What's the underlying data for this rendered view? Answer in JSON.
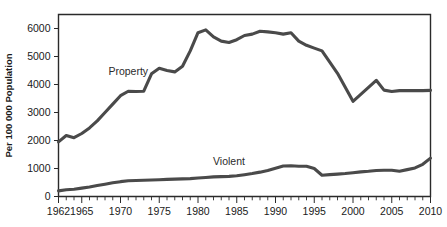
{
  "chart_data": {
    "type": "line",
    "title": "",
    "xlabel": "",
    "ylabel": "Per 100 000 Population",
    "xlim": [
      1962,
      2010
    ],
    "ylim": [
      0,
      6500
    ],
    "grid": false,
    "legend_position": "inline-labels",
    "y_ticks": [
      0,
      1000,
      2000,
      3000,
      4000,
      5000,
      6000
    ],
    "y_tick_labels": [
      "0",
      "1000",
      "2000",
      "3000",
      "4000",
      "5000",
      "6000"
    ],
    "x_tick_labels": [
      "1962",
      "1965",
      "1970",
      "1975",
      "1980",
      "1985",
      "1990",
      "1995",
      "2000",
      "2005",
      "2010"
    ],
    "x_tick_values": [
      1962,
      1965,
      1970,
      1975,
      1980,
      1985,
      1990,
      1995,
      2000,
      2005,
      2010
    ],
    "x_minor_tick_step": 1,
    "x": [
      1962,
      1963,
      1964,
      1965,
      1966,
      1967,
      1968,
      1969,
      1970,
      1971,
      1972,
      1973,
      1974,
      1975,
      1976,
      1977,
      1978,
      1979,
      1980,
      1981,
      1982,
      1983,
      1984,
      1985,
      1986,
      1987,
      1988,
      1989,
      1990,
      1991,
      1992,
      1993,
      1994,
      1995,
      1996,
      1997,
      1998,
      1999,
      2000,
      2001,
      2002,
      2003,
      2004,
      2005,
      2006,
      2007,
      2008,
      2009,
      2010
    ],
    "series": [
      {
        "name": "Property",
        "color": "#4a4a4a",
        "label": "Property",
        "label_x": 1971,
        "label_y": 4350,
        "values": [
          1950,
          2180,
          2100,
          2250,
          2450,
          2700,
          3000,
          3300,
          3600,
          3760,
          3750,
          3760,
          4380,
          4580,
          4500,
          4450,
          4650,
          5200,
          5850,
          5950,
          5700,
          5550,
          5500,
          5600,
          5750,
          5800,
          5900,
          5880,
          5850,
          5800,
          5850,
          5550,
          5400,
          5300,
          5200,
          4800,
          4400,
          3900,
          3400,
          3650,
          3900,
          4150,
          3800,
          3750,
          3780,
          3780,
          3780,
          3780,
          3790
        ]
      },
      {
        "name": "Violent",
        "color": "#4a4a4a",
        "label": "Violent",
        "label_x": 1984,
        "label_y": 1130,
        "values": [
          200,
          240,
          260,
          300,
          340,
          390,
          440,
          490,
          530,
          560,
          570,
          580,
          590,
          600,
          610,
          620,
          630,
          640,
          660,
          680,
          700,
          710,
          720,
          740,
          780,
          820,
          870,
          930,
          1010,
          1090,
          1100,
          1080,
          1080,
          1000,
          760,
          780,
          800,
          820,
          850,
          880,
          900,
          930,
          940,
          940,
          900,
          960,
          1020,
          1150,
          1370
        ]
      }
    ]
  },
  "axes": {
    "ylabel": "Per 100 000 Population"
  }
}
